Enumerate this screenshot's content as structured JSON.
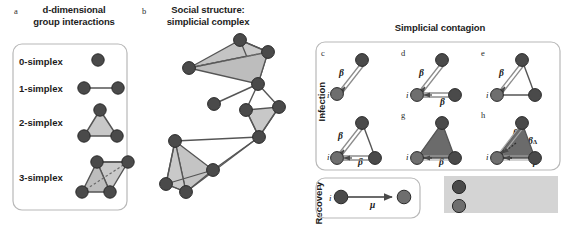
{
  "figure": {
    "width": 567,
    "height": 226,
    "background": "#ffffff"
  },
  "colors": {
    "node_infected": "#4a4a4a",
    "node_susceptible": "#6e6e6e",
    "node_stroke": "#2a2a2a",
    "edge": "#555555",
    "triangle_light": "#c8c8c8",
    "triangle_dark": "#6b6b6b",
    "panel_border": "#b4b4b4",
    "legend_bg": "#d4d4d4",
    "text": "#1c1c1c"
  },
  "panel_a": {
    "letter": "a",
    "title_line1": "d-dimensional",
    "title_line2": "group interactions",
    "rows": [
      {
        "label": "0-simplex"
      },
      {
        "label": "1-simplex"
      },
      {
        "label": "2-simplex"
      },
      {
        "label": "3-simplex"
      }
    ]
  },
  "panel_b": {
    "letter": "b",
    "title_line1": "Social structure:",
    "title_line2": "simplicial complex"
  },
  "panel_contagion": {
    "title": "Simplicial contagion",
    "axis_infection": "Infection",
    "axis_recovery": "Recovery",
    "subpanels": [
      {
        "letter": "c",
        "node_label": "i",
        "rates": [
          "β"
        ]
      },
      {
        "letter": "d",
        "node_label": "i",
        "rates": [
          "β",
          "β"
        ]
      },
      {
        "letter": "e",
        "node_label": "i",
        "rates": [
          "β"
        ]
      },
      {
        "letter": "f",
        "node_label": "i",
        "rates": [
          "β",
          "β"
        ]
      },
      {
        "letter": "g",
        "node_label": "i",
        "rates": [
          "β"
        ]
      },
      {
        "letter": "h",
        "node_label": "i",
        "rates": [
          "β",
          "β",
          "βΔ"
        ]
      }
    ],
    "recovery": {
      "letter": "i",
      "node_label": "i",
      "rate": "μ"
    }
  },
  "legend": {
    "items": [
      {
        "label": "Infected",
        "color": "#4a4a4a"
      },
      {
        "label": "Susceptible",
        "color": "#6e6e6e"
      }
    ]
  },
  "labels": {
    "beta": "β",
    "beta_delta_main": "β",
    "beta_delta_sub": "Δ",
    "mu": "μ",
    "i": "i"
  }
}
